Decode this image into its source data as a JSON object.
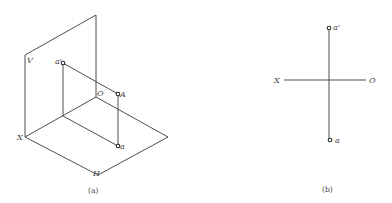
{
  "figure_a": {
    "caption": "(a)",
    "labels": {
      "V": "V",
      "a_prime": "a'",
      "O": "O",
      "A": "A",
      "X": "X",
      "a": "a",
      "H": "H"
    }
  },
  "figure_b": {
    "caption": "(b)",
    "labels": {
      "X": "X",
      "O": "O",
      "a_prime": "a'",
      "a": "a"
    }
  },
  "colors": {
    "line": "#3a3a3a",
    "text": "#444444",
    "background": "#ffffff"
  }
}
